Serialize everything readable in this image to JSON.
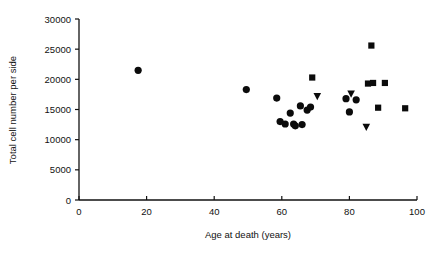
{
  "chart_data": {
    "type": "scatter",
    "title": "",
    "xlabel": "Age at death (years)",
    "ylabel": "Total cell number per side",
    "xlim": [
      0,
      100
    ],
    "ylim": [
      0,
      30000
    ],
    "xticks": [
      0,
      20,
      40,
      60,
      80,
      100
    ],
    "yticks": [
      0,
      5000,
      10000,
      15000,
      20000,
      25000,
      30000
    ],
    "xtick_labels": [
      "0",
      "20",
      "40",
      "60",
      "80",
      "100"
    ],
    "ytick_labels": [
      "0",
      "5000",
      "10000",
      "15000",
      "20000",
      "25000",
      "30000"
    ],
    "grid": false,
    "legend": "none",
    "marker_color": "#0b0b0b",
    "series": [
      {
        "name": "circle",
        "marker": "circle",
        "points": [
          {
            "x": 17.5,
            "y": 21500
          },
          {
            "x": 49.5,
            "y": 18300
          },
          {
            "x": 58.5,
            "y": 16900
          },
          {
            "x": 59.5,
            "y": 13000
          },
          {
            "x": 61.0,
            "y": 12600
          },
          {
            "x": 62.5,
            "y": 14400
          },
          {
            "x": 63.5,
            "y": 12600
          },
          {
            "x": 64.0,
            "y": 12300
          },
          {
            "x": 65.5,
            "y": 15600
          },
          {
            "x": 66.0,
            "y": 12500
          },
          {
            "x": 67.5,
            "y": 14900
          },
          {
            "x": 68.5,
            "y": 15400
          },
          {
            "x": 79.0,
            "y": 16800
          },
          {
            "x": 80.0,
            "y": 14600
          },
          {
            "x": 82.0,
            "y": 16600
          }
        ]
      },
      {
        "name": "square",
        "marker": "square",
        "points": [
          {
            "x": 69.0,
            "y": 20300
          },
          {
            "x": 86.5,
            "y": 25600
          },
          {
            "x": 85.5,
            "y": 19300
          },
          {
            "x": 87.0,
            "y": 19400
          },
          {
            "x": 90.5,
            "y": 19400
          },
          {
            "x": 88.5,
            "y": 15300
          },
          {
            "x": 96.5,
            "y": 15200
          }
        ]
      },
      {
        "name": "triangle-down",
        "marker": "triangle-down",
        "points": [
          {
            "x": 70.5,
            "y": 17200
          },
          {
            "x": 80.5,
            "y": 17600
          },
          {
            "x": 85.0,
            "y": 12100
          }
        ]
      }
    ]
  }
}
